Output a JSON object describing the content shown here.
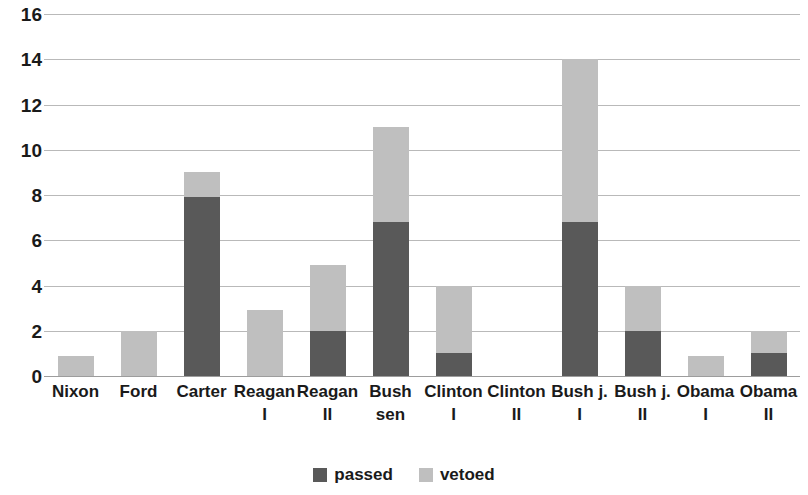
{
  "chart_data": {
    "type": "bar",
    "subtype": "stacked-bar",
    "title": "",
    "subtitle": "",
    "xlabel": "",
    "ylabel": "",
    "ylim": [
      0,
      16
    ],
    "ytick_step": 2,
    "yticks": [
      0,
      2,
      4,
      6,
      8,
      10,
      12,
      14,
      16
    ],
    "ytick_labels": [
      "0",
      "2",
      "4",
      "6",
      "8",
      "10",
      "12",
      "14",
      "16"
    ],
    "grid": true,
    "grid_axis": "y",
    "legend_position": "bottom",
    "categories": [
      "Nixon",
      "Ford",
      "Carter",
      "Reagan I",
      "Reagan II",
      "Bush sen",
      "Clinton I",
      "Clinton II",
      "Bush j. I",
      "Bush j. II",
      "Obama I",
      "Obama II"
    ],
    "category_lines": [
      [
        "Nixon",
        ""
      ],
      [
        "Ford",
        ""
      ],
      [
        "Carter",
        ""
      ],
      [
        "Reagan",
        "I"
      ],
      [
        "Reagan",
        "II"
      ],
      [
        "Bush",
        "sen"
      ],
      [
        "Clinton",
        "I"
      ],
      [
        "Clinton",
        "II"
      ],
      [
        "Bush j.",
        "I"
      ],
      [
        "Bush j.",
        "II"
      ],
      [
        "Obama",
        "I"
      ],
      [
        "Obama",
        "II"
      ]
    ],
    "series": [
      {
        "name": "passed",
        "color": "#595959",
        "values": [
          0,
          0,
          7.9,
          0,
          2,
          6.8,
          1,
          0,
          6.8,
          2,
          0,
          1
        ]
      },
      {
        "name": "vetoed",
        "color": "#bfbfbf",
        "values": [
          0.9,
          2,
          1.1,
          2.9,
          2.9,
          4.2,
          3,
          0,
          7.2,
          2,
          0.9,
          1
        ]
      }
    ],
    "totals": [
      0.9,
      2,
      9,
      2.9,
      4.9,
      11,
      4,
      0,
      14,
      4,
      0.9,
      2
    ]
  },
  "legend": {
    "items": [
      {
        "label": "passed",
        "color": "#595959"
      },
      {
        "label": "vetoed",
        "color": "#bfbfbf"
      }
    ]
  },
  "colors": {
    "passed": "#595959",
    "vetoed": "#bfbfbf",
    "gridline": "#b9b9b9",
    "axis": "#9d9d9d",
    "text": "#1a1a1a",
    "background": "#ffffff"
  }
}
